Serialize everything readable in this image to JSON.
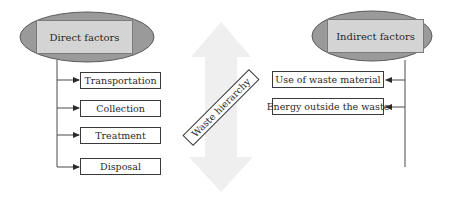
{
  "diagram": {
    "left_group": {
      "header": "Direct factors",
      "items": [
        "Transportation",
        "Collection",
        "Treatment",
        "Disposal"
      ],
      "arrow_direction": "right"
    },
    "right_group": {
      "header": "Indirect factors",
      "items": [
        "Use of waste material",
        "Energy outside the waste"
      ],
      "arrow_direction": "left"
    },
    "center": {
      "label": "Waste hierarchy",
      "arrow": "double-headed-vertical"
    },
    "colors": {
      "ellipse_fill": "#9a9a9a",
      "header_box_fill": "#d4d4d4",
      "big_arrow_fill": "#efefef",
      "line": "#4a4a4a"
    }
  }
}
